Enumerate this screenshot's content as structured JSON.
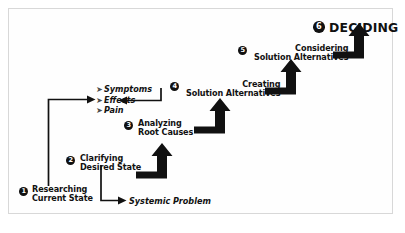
{
  "diagram": {
    "frame": {
      "border_color": "#d8d8d8",
      "background": "#ffffff"
    },
    "ink_color": "#111111",
    "steps": [
      {
        "number": "1",
        "line1": "Researching",
        "line2": "Current State"
      },
      {
        "number": "2",
        "line1": "Clarifying",
        "line2": "Desired State"
      },
      {
        "number": "3",
        "line1": "Analyzing",
        "line2": "Root Causes"
      },
      {
        "number": "4",
        "line1": "Creating",
        "line2": "Solution Alternatives"
      },
      {
        "number": "5",
        "line1": "Considering",
        "line2": "Solution Alternatives"
      },
      {
        "number": "6",
        "line1": "DECIDING",
        "line2": ""
      }
    ],
    "findings": {
      "bullet_marker": "➤",
      "items": [
        "Symptoms",
        "Effects",
        "Pain"
      ]
    },
    "outputs": {
      "systemic_problem": "Systemic Problem"
    }
  }
}
